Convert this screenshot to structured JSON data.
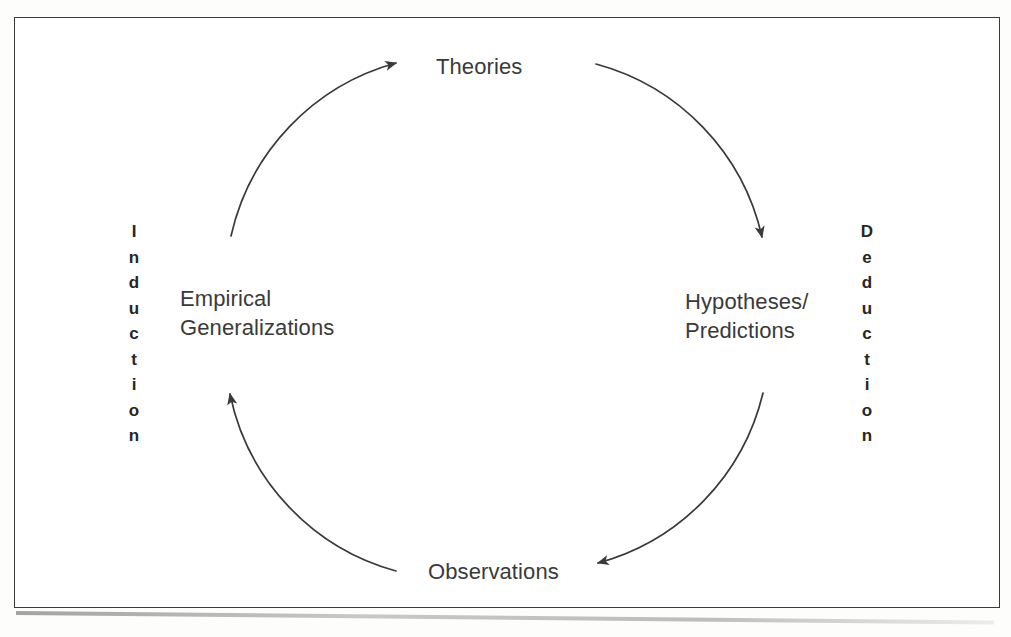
{
  "figure": {
    "type": "cycle-diagram",
    "title_visible": false,
    "background_color": "#ffffff",
    "frame_color": "#3b3b3b",
    "stroke_color": "#3a3a3a",
    "text_color": "#3a3a3a",
    "caption_color": "#262626"
  },
  "nodes": {
    "theories": "Theories",
    "hypotheses": "Hypotheses/\nPredictions",
    "observations": "Observations",
    "empirical": "Empirical\nGeneralizations"
  },
  "captions": {
    "induction": "Induction",
    "deduction": "Deduction"
  },
  "chart_data": {
    "type": "diagram",
    "diagram_kind": "circular process cycle",
    "nodes": [
      {
        "id": "theories",
        "label": "Theories",
        "position": "top"
      },
      {
        "id": "hypotheses",
        "label": "Hypotheses/Predictions",
        "position": "right"
      },
      {
        "id": "observations",
        "label": "Observations",
        "position": "bottom"
      },
      {
        "id": "empirical",
        "label": "Empirical Generalizations",
        "position": "left"
      }
    ],
    "edges": [
      {
        "from": "theories",
        "to": "hypotheses",
        "direction": "clockwise",
        "side": "right-upper",
        "phase": "Deduction"
      },
      {
        "from": "hypotheses",
        "to": "observations",
        "direction": "clockwise",
        "side": "right-lower",
        "phase": "Deduction"
      },
      {
        "from": "observations",
        "to": "empirical",
        "direction": "clockwise",
        "side": "left-lower",
        "phase": "Induction"
      },
      {
        "from": "empirical",
        "to": "theories",
        "direction": "clockwise",
        "side": "left-upper",
        "phase": "Induction"
      }
    ],
    "annotations": [
      {
        "text": "Induction",
        "position": "far-left",
        "orientation": "vertical-stacked",
        "covers": [
          "observations->empirical",
          "empirical->theories"
        ]
      },
      {
        "text": "Deduction",
        "position": "far-right",
        "orientation": "vertical-stacked",
        "covers": [
          "theories->hypotheses",
          "hypotheses->observations"
        ]
      }
    ],
    "geometry": {
      "center_x": 496,
      "center_y": 316,
      "radius": 232
    }
  }
}
